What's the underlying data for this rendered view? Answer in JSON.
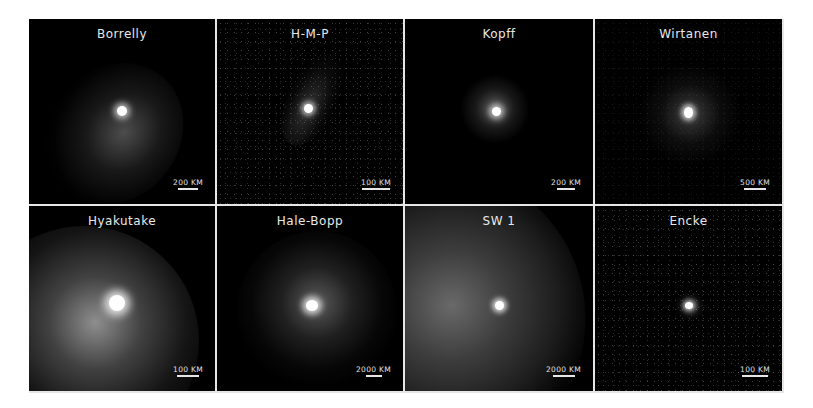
{
  "figure": {
    "type": "comet image mosaic",
    "layout": {
      "rows": 2,
      "columns": 4
    },
    "background_color": "#ffffff",
    "panel_color": "#000000",
    "border_color": "#e6e6e6"
  },
  "panels": [
    {
      "name": "Borrelly",
      "scale_label": "200 KM",
      "scale_bar_px": 20
    },
    {
      "name": "H-M-P",
      "scale_label": "100 KM",
      "scale_bar_px": 28
    },
    {
      "name": "Kopff",
      "scale_label": "200 KM",
      "scale_bar_px": 18
    },
    {
      "name": "Wirtanen",
      "scale_label": "500 KM",
      "scale_bar_px": 22
    },
    {
      "name": "Hyakutake",
      "scale_label": "100 KM",
      "scale_bar_px": 22
    },
    {
      "name": "Hale-Bopp",
      "scale_label": "2000 KM",
      "scale_bar_px": 16
    },
    {
      "name": "SW 1",
      "scale_label": "2000 KM",
      "scale_bar_px": 22
    },
    {
      "name": "Encke",
      "scale_label": "100 KM",
      "scale_bar_px": 26
    }
  ]
}
